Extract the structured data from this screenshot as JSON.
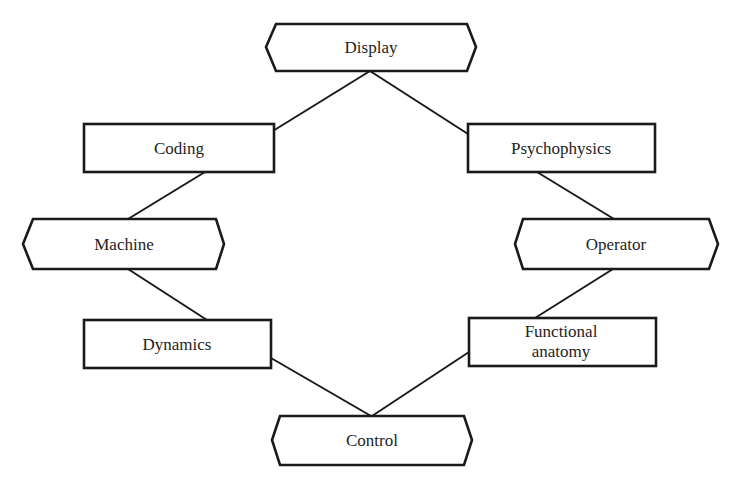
{
  "diagram": {
    "type": "network-diagram",
    "background": "#ffffff",
    "stroke_color": "#1a1a1a",
    "text_color": "#1e1e1e",
    "nodes": [
      {
        "id": "display",
        "label": "Display",
        "shape": "hexagon",
        "x": 267,
        "y": 24,
        "w": 208,
        "h": 47
      },
      {
        "id": "coding",
        "label": "Coding",
        "shape": "rectangle",
        "x": 84,
        "y": 124,
        "w": 190,
        "h": 48
      },
      {
        "id": "psychophysics",
        "label": "Psychophysics",
        "shape": "rectangle",
        "x": 468,
        "y": 124,
        "w": 187,
        "h": 48
      },
      {
        "id": "machine",
        "label": "Machine",
        "shape": "hexagon",
        "x": 23,
        "y": 219,
        "w": 201,
        "h": 50
      },
      {
        "id": "operator",
        "label": "Operator",
        "shape": "hexagon",
        "x": 515,
        "y": 219,
        "w": 203,
        "h": 50
      },
      {
        "id": "dynamics",
        "label": "Dynamics",
        "shape": "rectangle",
        "x": 84,
        "y": 320,
        "w": 187,
        "h": 48
      },
      {
        "id": "functional_anatomy",
        "label_line1": "Functional",
        "label_line2": "anatomy",
        "shape": "rectangle",
        "x": 469,
        "y": 318,
        "w": 187,
        "h": 48
      },
      {
        "id": "control",
        "label": "Control",
        "shape": "hexagon",
        "x": 272,
        "y": 416,
        "w": 200,
        "h": 49
      }
    ],
    "edges": [
      {
        "from": "display",
        "to": "coding"
      },
      {
        "from": "display",
        "to": "psychophysics"
      },
      {
        "from": "coding",
        "to": "machine"
      },
      {
        "from": "machine",
        "to": "dynamics"
      },
      {
        "from": "psychophysics",
        "to": "operator"
      },
      {
        "from": "operator",
        "to": "functional_anatomy"
      },
      {
        "from": "dynamics",
        "to": "control"
      },
      {
        "from": "functional_anatomy",
        "to": "control"
      }
    ]
  },
  "labels": {
    "display": "Display",
    "coding": "Coding",
    "psychophysics": "Psychophysics",
    "machine": "Machine",
    "operator": "Operator",
    "dynamics": "Dynamics",
    "functional_line1": "Functional",
    "functional_line2": "anatomy",
    "control": "Control"
  }
}
